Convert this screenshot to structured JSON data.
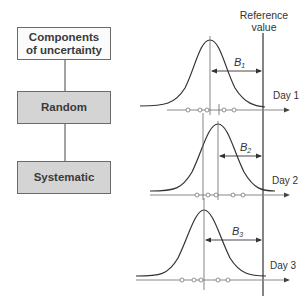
{
  "hierarchy": {
    "root": "Components\nof uncertainty",
    "root_line1": "Components",
    "root_line2": "of uncertainty",
    "child1": "Random",
    "child2": "Systematic"
  },
  "reference": {
    "line1": "Reference",
    "line2": "value"
  },
  "days": [
    {
      "label": "Day 1",
      "bias_label": "B",
      "bias_sub": "1"
    },
    {
      "label": "Day 2",
      "bias_label": "B",
      "bias_sub": "2"
    },
    {
      "label": "Day 3",
      "bias_label": "B",
      "bias_sub": "3"
    }
  ],
  "colors": {
    "box_white": "#fbfbfb",
    "box_gray": "#d4d4d4",
    "line": "#333333",
    "axis": "#888888"
  }
}
